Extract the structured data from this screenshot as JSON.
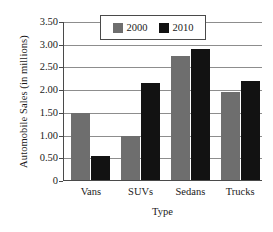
{
  "chart_data": {
    "type": "bar",
    "title": "",
    "xlabel": "Type",
    "ylabel": "Automobile Sales (in millions)",
    "categories": [
      "Vans",
      "SUVs",
      "Sedans",
      "Trucks"
    ],
    "series": [
      {
        "name": "2000",
        "color": "#6e6e6e",
        "values": [
          1.5,
          1.0,
          2.75,
          1.97
        ]
      },
      {
        "name": "2010",
        "color": "#121212",
        "values": [
          0.55,
          2.15,
          2.9,
          2.2
        ]
      }
    ],
    "ylim": [
      0,
      3.5
    ],
    "y_ticks": [
      0,
      0.5,
      1.0,
      1.5,
      2.0,
      2.5,
      3.0,
      3.5
    ],
    "y_tick_labels": [
      "0",
      "0.50",
      "1.00",
      "1.50",
      "2.00",
      "2.50",
      "3.00",
      "3.50"
    ],
    "grid": true,
    "legend_position": "top-center",
    "legend_entries": [
      "2000",
      "2010"
    ]
  }
}
